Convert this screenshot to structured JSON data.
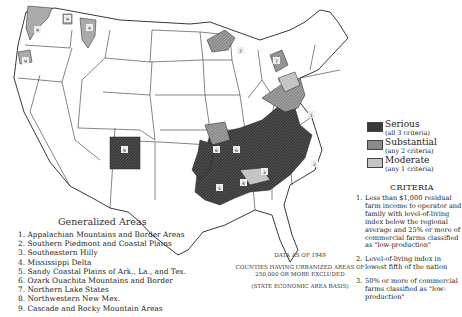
{
  "map": {
    "type": "choropleth",
    "subject": "Low-income rural farm areas of the United States",
    "data_date": "DATA AS OF 1949",
    "note_exclusion": "COUNTIES HAVING URBANIZED AREAS OF 250,000 OR MORE EXCLUDED",
    "note_basis": "(STATE ECONOMIC AREA BASIS)",
    "region_labels": [
      "1",
      "1",
      "2",
      "3",
      "4",
      "5",
      "5",
      "6",
      "6",
      "7",
      "8",
      "9",
      "9",
      "9",
      "9"
    ]
  },
  "legend": {
    "items": [
      {
        "label": "Serious",
        "sub": "(all 3 criteria)",
        "color": "#3a3a3a"
      },
      {
        "label": "Substantial",
        "sub": "(any 2 criteria)",
        "color": "#8a8a8a"
      },
      {
        "label": "Moderate",
        "sub": "(any 1 criteria)",
        "color": "#c4c4c4"
      }
    ]
  },
  "criteria": {
    "title": "CRITERIA",
    "items": [
      {
        "num": "1.",
        "text": "Less than $1,000 residual farm income to operator and family with level-of-living index below the regional average and 25% or more of commercial farms classified as \"low-production\""
      },
      {
        "num": "2.",
        "text": "Level-of-living index in lowest fifth of the nation"
      },
      {
        "num": "3.",
        "text": "50% or more of commercial farms classified as \"low-production\""
      }
    ]
  },
  "generalized_areas": {
    "title": "Generalized Areas",
    "items": [
      "1. Appalachian Mountains and Border Areas",
      "2. Southern Piedmont and Coastal Plains",
      "3. Southeastern Hilly",
      "4. Mississippi Delta",
      "5. Sandy Coastal Plains of Ark., La., and Tex.",
      "6. Ozark Ouachita Mountains and Border",
      "7. Northern Lake States",
      "8. Northwestern New Mex.",
      "9. Cascade and Rocky Mountain Areas"
    ]
  }
}
